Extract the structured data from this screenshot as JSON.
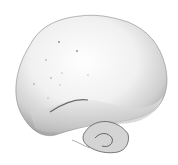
{
  "image": {
    "subject": "puffball mushroom illustration",
    "style": "stippled pencil drawing",
    "colors": {
      "background": "#ffffff",
      "body_light": "#f4f4f4",
      "body_mid": "#d6d6d6",
      "shadow": "#9a9a9a",
      "dark": "#555555"
    }
  }
}
